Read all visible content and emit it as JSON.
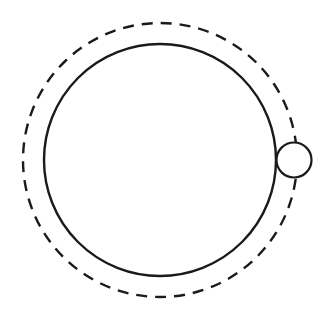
{
  "diagram": {
    "stroke_color": "#1a1a1a",
    "background": "#ffffff",
    "orbit": {
      "style": "dashed",
      "cx": 160,
      "cy": 160,
      "r": 137,
      "stroke_width": 2.4,
      "dash": "11 8"
    },
    "central_body": {
      "style": "solid",
      "cx": 160,
      "cy": 160,
      "r": 116,
      "stroke_width": 2.4
    },
    "orbiting_body": {
      "style": "solid",
      "cx": 294,
      "cy": 160,
      "r": 17.5,
      "stroke_width": 2.2
    }
  }
}
